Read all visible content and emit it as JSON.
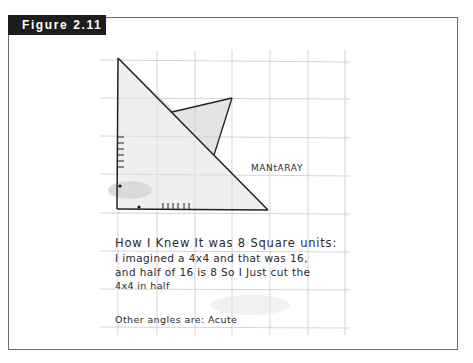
{
  "figure": {
    "label": "Figure 2.11",
    "label_bg": "#1d1d1d",
    "frame_color": "#6b6b6b"
  },
  "drawing": {
    "label": "MANtARAY",
    "grid_color": "#c8c8c8",
    "shading_color": "#d8d8d8",
    "line_color": "#222222"
  },
  "text": {
    "heading": "How I Knew It was 8 Square units:",
    "lines": [
      "I imagined a 4x4 and that was 16,",
      "and half of 16 is 8  So I Just cut the",
      "4x4 in half"
    ],
    "footer": "Other angles are: Acute"
  }
}
